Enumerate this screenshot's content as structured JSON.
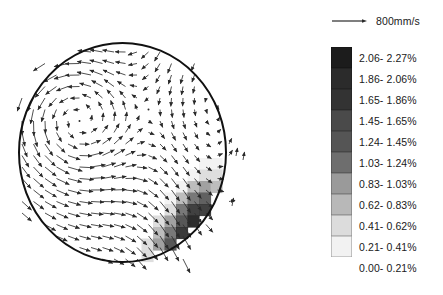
{
  "scale_reference": {
    "label": "800mm/s",
    "icon": "scale-arrow-icon",
    "length_px": 34
  },
  "plot": {
    "boundary": {
      "shape": "circle",
      "cx": 122.5,
      "cy": 152.5,
      "rx": 103.5,
      "ry": 109.5
    },
    "stroke_color": "#111111"
  },
  "chart_data": {
    "type": "heatmap",
    "title": "",
    "xlabel": "",
    "ylabel": "",
    "grid": false,
    "legend_position": "right",
    "overlay": "vector-field",
    "units": "%",
    "colorbar_levels": [
      {
        "index": 10,
        "label": "2.06- 2.27%",
        "min": 2.06,
        "max": 2.27,
        "color": "#1c1c1c"
      },
      {
        "index": 9,
        "label": "1.86- 2.06%",
        "min": 1.86,
        "max": 2.06,
        "color": "#2b2b2b"
      },
      {
        "index": 8,
        "label": "1.65- 1.86%",
        "min": 1.65,
        "max": 1.86,
        "color": "#333333"
      },
      {
        "index": 7,
        "label": "1.45- 1.65%",
        "min": 1.45,
        "max": 1.65,
        "color": "#4a4a4a"
      },
      {
        "index": 6,
        "label": "1.24- 1.45%",
        "min": 1.24,
        "max": 1.45,
        "color": "#555555"
      },
      {
        "index": 5,
        "label": "1.03- 1.24%",
        "min": 1.03,
        "max": 1.24,
        "color": "#6e6e6e"
      },
      {
        "index": 4,
        "label": "0.83- 1.03%",
        "min": 0.83,
        "max": 1.03,
        "color": "#9a9a9a"
      },
      {
        "index": 3,
        "label": "0.62- 0.83%",
        "min": 0.62,
        "max": 0.83,
        "color": "#b8b8b8"
      },
      {
        "index": 2,
        "label": "0.41- 0.62%",
        "min": 0.41,
        "max": 0.62,
        "color": "#dcdcdc"
      },
      {
        "index": 1,
        "label": "0.21- 0.41%",
        "min": 0.21,
        "max": 0.41,
        "color": "#f2f2f2"
      },
      {
        "index": 0,
        "label": "0.00- 0.21%",
        "min": 0.0,
        "max": 0.21,
        "color": "#ffffff"
      }
    ],
    "cell_size": 11.5,
    "origin": [
      38,
      66
    ],
    "cells": [
      {
        "x": 14,
        "y": 8,
        "v": 1
      },
      {
        "x": 15,
        "y": 8,
        "v": 1
      },
      {
        "x": 13,
        "y": 9,
        "v": 1
      },
      {
        "x": 14,
        "y": 9,
        "v": 2
      },
      {
        "x": 15,
        "y": 9,
        "v": 2
      },
      {
        "x": 16,
        "y": 9,
        "v": 1
      },
      {
        "x": 12,
        "y": 10,
        "v": 1
      },
      {
        "x": 13,
        "y": 10,
        "v": 3
      },
      {
        "x": 14,
        "y": 10,
        "v": 4
      },
      {
        "x": 15,
        "y": 10,
        "v": 3
      },
      {
        "x": 16,
        "y": 10,
        "v": 2
      },
      {
        "x": 17,
        "y": 10,
        "v": 1
      },
      {
        "x": 11,
        "y": 11,
        "v": 1
      },
      {
        "x": 12,
        "y": 11,
        "v": 3
      },
      {
        "x": 13,
        "y": 11,
        "v": 5
      },
      {
        "x": 14,
        "y": 11,
        "v": 6
      },
      {
        "x": 15,
        "y": 11,
        "v": 4
      },
      {
        "x": 16,
        "y": 11,
        "v": 3
      },
      {
        "x": 17,
        "y": 11,
        "v": 2
      },
      {
        "x": 11,
        "y": 12,
        "v": 2
      },
      {
        "x": 12,
        "y": 12,
        "v": 5
      },
      {
        "x": 13,
        "y": 12,
        "v": 8
      },
      {
        "x": 14,
        "y": 12,
        "v": 8
      },
      {
        "x": 15,
        "y": 12,
        "v": 6
      },
      {
        "x": 16,
        "y": 12,
        "v": 4
      },
      {
        "x": 17,
        "y": 12,
        "v": 2
      },
      {
        "x": 10,
        "y": 13,
        "v": 2
      },
      {
        "x": 11,
        "y": 13,
        "v": 4
      },
      {
        "x": 12,
        "y": 13,
        "v": 7
      },
      {
        "x": 13,
        "y": 13,
        "v": 10
      },
      {
        "x": 14,
        "y": 13,
        "v": 9
      },
      {
        "x": 15,
        "y": 13,
        "v": 7
      },
      {
        "x": 16,
        "y": 13,
        "v": 5
      },
      {
        "x": 17,
        "y": 13,
        "v": 3
      },
      {
        "x": 10,
        "y": 14,
        "v": 3
      },
      {
        "x": 11,
        "y": 14,
        "v": 5
      },
      {
        "x": 12,
        "y": 14,
        "v": 9
      },
      {
        "x": 13,
        "y": 14,
        "v": 10
      },
      {
        "x": 14,
        "y": 14,
        "v": 9
      },
      {
        "x": 15,
        "y": 14,
        "v": 8
      },
      {
        "x": 16,
        "y": 14,
        "v": 5
      },
      {
        "x": 17,
        "y": 14,
        "v": 3
      },
      {
        "x": 9,
        "y": 15,
        "v": 2
      },
      {
        "x": 10,
        "y": 15,
        "v": 4
      },
      {
        "x": 11,
        "y": 15,
        "v": 7
      },
      {
        "x": 12,
        "y": 15,
        "v": 10
      },
      {
        "x": 13,
        "y": 15,
        "v": 10
      },
      {
        "x": 14,
        "y": 15,
        "v": 8
      },
      {
        "x": 15,
        "y": 15,
        "v": 7
      },
      {
        "x": 16,
        "y": 15,
        "v": 4
      },
      {
        "x": 17,
        "y": 15,
        "v": 2
      },
      {
        "x": 9,
        "y": 16,
        "v": 2
      },
      {
        "x": 10,
        "y": 16,
        "v": 5
      },
      {
        "x": 11,
        "y": 16,
        "v": 8
      },
      {
        "x": 12,
        "y": 16,
        "v": 10
      },
      {
        "x": 13,
        "y": 16,
        "v": 9
      },
      {
        "x": 14,
        "y": 16,
        "v": 8
      },
      {
        "x": 15,
        "y": 16,
        "v": 6
      },
      {
        "x": 16,
        "y": 16,
        "v": 3
      },
      {
        "x": 8,
        "y": 17,
        "v": 2
      },
      {
        "x": 9,
        "y": 17,
        "v": 4
      },
      {
        "x": 10,
        "y": 17,
        "v": 7
      },
      {
        "x": 11,
        "y": 17,
        "v": 9
      },
      {
        "x": 12,
        "y": 17,
        "v": 8
      },
      {
        "x": 13,
        "y": 17,
        "v": 8
      },
      {
        "x": 14,
        "y": 17,
        "v": 7
      },
      {
        "x": 15,
        "y": 17,
        "v": 5
      },
      {
        "x": 16,
        "y": 17,
        "v": 3
      },
      {
        "x": 8,
        "y": 18,
        "v": 2
      },
      {
        "x": 9,
        "y": 18,
        "v": 4
      },
      {
        "x": 10,
        "y": 18,
        "v": 6
      },
      {
        "x": 11,
        "y": 18,
        "v": 7
      },
      {
        "x": 12,
        "y": 18,
        "v": 8
      },
      {
        "x": 13,
        "y": 18,
        "v": 9
      },
      {
        "x": 14,
        "y": 18,
        "v": 7
      },
      {
        "x": 15,
        "y": 18,
        "v": 4
      },
      {
        "x": 16,
        "y": 18,
        "v": 2
      },
      {
        "x": 7,
        "y": 19,
        "v": 1
      },
      {
        "x": 8,
        "y": 19,
        "v": 3
      },
      {
        "x": 9,
        "y": 19,
        "v": 4
      },
      {
        "x": 10,
        "y": 19,
        "v": 5
      },
      {
        "x": 11,
        "y": 19,
        "v": 6
      },
      {
        "x": 12,
        "y": 19,
        "v": 8
      },
      {
        "x": 13,
        "y": 19,
        "v": 8
      },
      {
        "x": 14,
        "y": 19,
        "v": 6
      },
      {
        "x": 15,
        "y": 19,
        "v": 3
      },
      {
        "x": 6,
        "y": 20,
        "v": 2
      },
      {
        "x": 7,
        "y": 20,
        "v": 3
      },
      {
        "x": 8,
        "y": 20,
        "v": 4
      },
      {
        "x": 9,
        "y": 20,
        "v": 4
      },
      {
        "x": 10,
        "y": 20,
        "v": 5
      },
      {
        "x": 11,
        "y": 20,
        "v": 7
      },
      {
        "x": 12,
        "y": 20,
        "v": 7
      },
      {
        "x": 13,
        "y": 20,
        "v": 5
      },
      {
        "x": 14,
        "y": 20,
        "v": 3
      },
      {
        "x": 5,
        "y": 21,
        "v": 2
      },
      {
        "x": 6,
        "y": 21,
        "v": 3
      },
      {
        "x": 7,
        "y": 21,
        "v": 9
      },
      {
        "x": 8,
        "y": 21,
        "v": 4
      },
      {
        "x": 9,
        "y": 21,
        "v": 3
      },
      {
        "x": 10,
        "y": 21,
        "v": 4
      },
      {
        "x": 11,
        "y": 21,
        "v": 6
      },
      {
        "x": 12,
        "y": 21,
        "v": 6
      },
      {
        "x": 13,
        "y": 21,
        "v": 4
      },
      {
        "x": 14,
        "y": 21,
        "v": 2
      },
      {
        "x": 4,
        "y": 22,
        "v": 1
      },
      {
        "x": 5,
        "y": 22,
        "v": 2
      },
      {
        "x": 6,
        "y": 22,
        "v": 3
      },
      {
        "x": 7,
        "y": 22,
        "v": 3
      },
      {
        "x": 8,
        "y": 22,
        "v": 3
      },
      {
        "x": 9,
        "y": 22,
        "v": 3
      },
      {
        "x": 10,
        "y": 22,
        "v": 4
      },
      {
        "x": 11,
        "y": 22,
        "v": 5
      },
      {
        "x": 12,
        "y": 22,
        "v": 4
      },
      {
        "x": 13,
        "y": 22,
        "v": 3
      },
      {
        "x": 4,
        "y": 23,
        "v": 1
      },
      {
        "x": 5,
        "y": 23,
        "v": 2
      },
      {
        "x": 6,
        "y": 23,
        "v": 2
      },
      {
        "x": 7,
        "y": 23,
        "v": 2
      },
      {
        "x": 8,
        "y": 23,
        "v": 2
      },
      {
        "x": 9,
        "y": 23,
        "v": 3
      },
      {
        "x": 10,
        "y": 23,
        "v": 3
      },
      {
        "x": 11,
        "y": 23,
        "v": 3
      },
      {
        "x": 12,
        "y": 23,
        "v": 2
      }
    ]
  },
  "vector_field": {
    "description": "recirculating swirl, counter-clockwise in upper-left quadrant",
    "color": "#333333",
    "arrow_count": 260
  }
}
